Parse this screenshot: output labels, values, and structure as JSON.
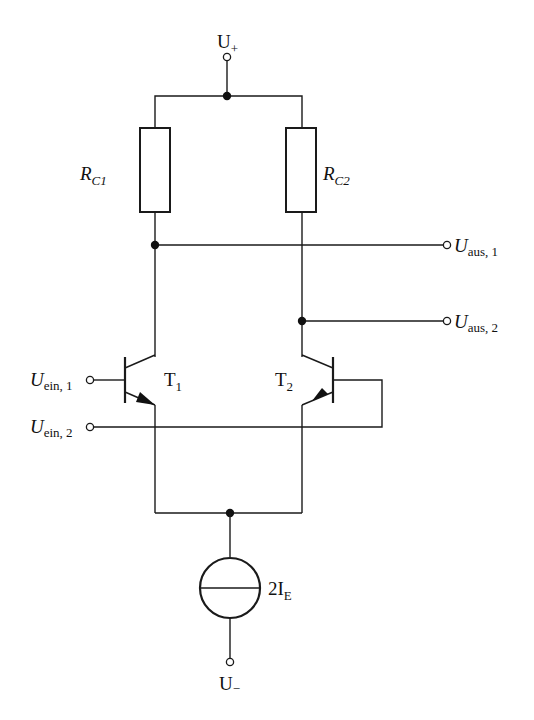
{
  "diagram": {
    "type": "circuit-schematic",
    "supply": {
      "positive": {
        "symbol": "U",
        "subscript": "+"
      },
      "negative": {
        "symbol": "U",
        "subscript": "−"
      }
    },
    "resistors": [
      {
        "id": "RC1",
        "symbol": "R",
        "subscript": "C1"
      },
      {
        "id": "RC2",
        "symbol": "R",
        "subscript": "C2"
      }
    ],
    "transistors": [
      {
        "id": "T1",
        "symbol": "T",
        "subscript": "1",
        "type": "NPN"
      },
      {
        "id": "T2",
        "symbol": "T",
        "subscript": "2",
        "type": "NPN"
      }
    ],
    "inputs": [
      {
        "id": "Uein1",
        "symbol": "U",
        "subscript": "ein, 1"
      },
      {
        "id": "Uein2",
        "symbol": "U",
        "subscript": "ein, 2"
      }
    ],
    "outputs": [
      {
        "id": "Uaus1",
        "symbol": "U",
        "subscript": "aus, 1"
      },
      {
        "id": "Uaus2",
        "symbol": "U",
        "subscript": "aus, 2"
      }
    ],
    "current_source": {
      "prefix": "2I",
      "subscript": "E"
    }
  }
}
